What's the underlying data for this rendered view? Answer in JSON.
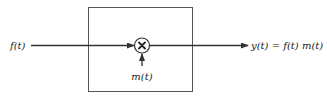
{
  "diagram": {
    "type": "block-diagram",
    "title": "",
    "input_label": "f(t)",
    "modulating_label": "m(t)",
    "output_label": "y(t) = f(t) m(t)",
    "operator_symbol": "×",
    "operator_name": "multiplier",
    "colors": {
      "stroke": "#333333",
      "box": "#555555",
      "text": "#222222",
      "background": "#ffffff"
    }
  }
}
